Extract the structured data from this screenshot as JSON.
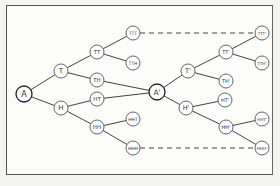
{
  "diagram": {
    "type": "tree",
    "colors": {
      "line": "#444444",
      "node_fill": "#ffffff",
      "node_stroke": "#555555",
      "background": "#fbfbf9"
    },
    "nodes": [
      {
        "id": "A",
        "label": "A",
        "x": 24,
        "y": 94,
        "r": 8,
        "root": true,
        "size": 8
      },
      {
        "id": "T",
        "label": "T",
        "x": 61,
        "y": 71,
        "r": 7,
        "size": 7
      },
      {
        "id": "H",
        "label": "H",
        "x": 61,
        "y": 108,
        "r": 7,
        "size": 7
      },
      {
        "id": "TT",
        "label": "TT",
        "x": 97,
        "y": 52,
        "r": 7,
        "size": 5.5
      },
      {
        "id": "TH",
        "label": "TH",
        "x": 97,
        "y": 80,
        "r": 7,
        "size": 5.5
      },
      {
        "id": "HT",
        "label": "HT",
        "x": 97,
        "y": 99,
        "r": 7,
        "size": 5.5
      },
      {
        "id": "HH",
        "label": "HH",
        "x": 97,
        "y": 127,
        "r": 7,
        "size": 5.5
      },
      {
        "id": "TTT",
        "label": "TTT",
        "x": 133,
        "y": 33,
        "r": 7,
        "size": 4.5
      },
      {
        "id": "TTH",
        "label": "TTH",
        "x": 133,
        "y": 63,
        "r": 7,
        "size": 4.5
      },
      {
        "id": "HHT",
        "label": "HHT",
        "x": 133,
        "y": 119,
        "r": 7,
        "size": 4.5
      },
      {
        "id": "HHH",
        "label": "HHH",
        "x": 133,
        "y": 148,
        "r": 7,
        "size": 4.5
      },
      {
        "id": "A2",
        "label": "A'",
        "x": 157,
        "y": 92,
        "r": 8,
        "root": true,
        "size": 7.5
      },
      {
        "id": "T2",
        "label": "T'",
        "x": 188,
        "y": 71,
        "r": 7,
        "size": 6.5
      },
      {
        "id": "H2",
        "label": "H'",
        "x": 186,
        "y": 108,
        "r": 7,
        "size": 6.5
      },
      {
        "id": "TT2",
        "label": "TT'",
        "x": 226,
        "y": 52,
        "r": 7,
        "size": 5
      },
      {
        "id": "TH2",
        "label": "TH'",
        "x": 226,
        "y": 81,
        "r": 7,
        "size": 5
      },
      {
        "id": "HT2",
        "label": "HT'",
        "x": 225,
        "y": 100,
        "r": 7,
        "size": 5
      },
      {
        "id": "HH2",
        "label": "HH'",
        "x": 226,
        "y": 127,
        "r": 7,
        "size": 5
      },
      {
        "id": "TTT2",
        "label": "TTT'",
        "x": 262,
        "y": 33,
        "r": 7,
        "size": 4.2
      },
      {
        "id": "TTH2",
        "label": "TTH'",
        "x": 262,
        "y": 63,
        "r": 7,
        "size": 4.2
      },
      {
        "id": "HHT2",
        "label": "HHT'",
        "x": 262,
        "y": 119,
        "r": 7,
        "size": 4.2
      },
      {
        "id": "HHH2",
        "label": "HHH'",
        "x": 262,
        "y": 148,
        "r": 7,
        "size": 4.2
      }
    ],
    "edges": [
      {
        "from": "A",
        "to": "T"
      },
      {
        "from": "A",
        "to": "H"
      },
      {
        "from": "T",
        "to": "TT"
      },
      {
        "from": "T",
        "to": "TH"
      },
      {
        "from": "H",
        "to": "HT"
      },
      {
        "from": "H",
        "to": "HH"
      },
      {
        "from": "TT",
        "to": "TTT"
      },
      {
        "from": "TT",
        "to": "TTH"
      },
      {
        "from": "HH",
        "to": "HHT"
      },
      {
        "from": "HH",
        "to": "HHH"
      },
      {
        "from": "TH",
        "to": "A2"
      },
      {
        "from": "HT",
        "to": "A2"
      },
      {
        "from": "A2",
        "to": "T2"
      },
      {
        "from": "A2",
        "to": "H2"
      },
      {
        "from": "T2",
        "to": "TT2"
      },
      {
        "from": "T2",
        "to": "TH2"
      },
      {
        "from": "H2",
        "to": "HT2"
      },
      {
        "from": "H2",
        "to": "HH2"
      },
      {
        "from": "TT2",
        "to": "TTT2"
      },
      {
        "from": "TT2",
        "to": "TTH2"
      },
      {
        "from": "HH2",
        "to": "HHT2"
      },
      {
        "from": "HH2",
        "to": "HHH2"
      }
    ],
    "dashed_edges": [
      {
        "from": "TTT",
        "to": "TTT2"
      },
      {
        "from": "HHH",
        "to": "HHH2"
      }
    ]
  }
}
